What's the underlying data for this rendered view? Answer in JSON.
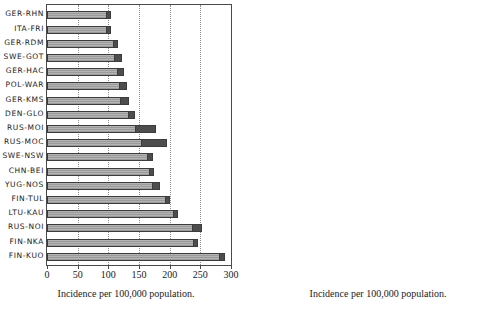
{
  "figure": {
    "panels": [
      {
        "id": "left",
        "axis_title": "Incidence per 100,000 population.",
        "chart_data": {
          "type": "bar",
          "orientation": "horizontal",
          "title": "",
          "xlabel": "Incidence per 100,000 population.",
          "ylabel": "",
          "xlim": [
            0,
            300
          ],
          "ticks": [
            0,
            50,
            100,
            150,
            200,
            250,
            300
          ],
          "tick_labels": [
            "0",
            "50",
            "100",
            "150",
            "200",
            "250",
            "300"
          ],
          "grid": true,
          "categories": [
            "GER-RHN",
            "ITA-FRI",
            "GER-RDM",
            "SWE-GOT",
            "GER-HAC",
            "POL-WAR",
            "GER-KMS",
            "DEN-GLO",
            "RUS-MOI",
            "RUS-MOC",
            "SWE-NSW",
            "CHN-BEI",
            "YUG-NOS",
            "FIN-TUL",
            "LTU-KAU",
            "RUS-NOI",
            "FIN-NKA",
            "FIN-KUO"
          ],
          "values": [
            104,
            104,
            115,
            122,
            126,
            131,
            133,
            143,
            178,
            195,
            173,
            175,
            185,
            201,
            214,
            253,
            246,
            290
          ],
          "cap_values": [
            4,
            4,
            4,
            9,
            9,
            11,
            11,
            7,
            32,
            38,
            6,
            6,
            10,
            5,
            5,
            13,
            5,
            7
          ]
        }
      },
      {
        "id": "right",
        "axis_title": "Incidence per 100,000 population.",
        "chart_data": {
          "type": "bar",
          "orientation": "horizontal",
          "title": "",
          "xlabel": "Incidence per 100,000 population.",
          "ylabel": "",
          "xlim": [
            0,
            300
          ],
          "ticks": [
            0,
            50,
            100,
            150,
            200,
            250,
            300
          ],
          "tick_labels": [
            "0",
            "50",
            "100",
            "150",
            "200",
            "250",
            "300"
          ],
          "grid": true,
          "categories": [
            "GER-RHN",
            "GER-RDM",
            "ITA-FRI",
            "POL-WAR",
            "SWE-GOT",
            "GER-HAC",
            "DEN-GLO",
            "RUS-MOI",
            "GER-KMS",
            "RUS-MOC",
            "FIN-TUL",
            "YUG-NOS",
            "SWE-NSW",
            "FIN-NKA",
            "CHN-BEI",
            "LTU-KAU",
            "FIN-KUO",
            "RUS-NOI"
          ],
          "values": [
            52,
            57,
            57,
            65,
            64,
            72,
            80,
            91,
            80,
            101,
            90,
            93,
            96,
            104,
            126,
            127,
            165,
            228
          ],
          "cap_values": [
            2,
            5,
            4,
            6,
            5,
            6,
            4,
            8,
            3,
            13,
            2,
            5,
            5,
            7,
            5,
            4,
            5,
            32
          ]
        }
      }
    ]
  }
}
